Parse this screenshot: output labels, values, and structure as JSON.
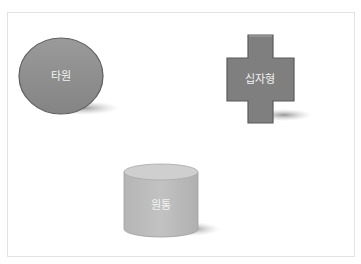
{
  "canvas": {
    "shapes": [
      {
        "id": "ellipse",
        "label": "타원",
        "fill": "#8c8c8c"
      },
      {
        "id": "cross",
        "label": "십자형",
        "fill": "#7f7f7f"
      },
      {
        "id": "cylinder",
        "label": "원통",
        "fill": "#bdbdbd"
      }
    ]
  }
}
